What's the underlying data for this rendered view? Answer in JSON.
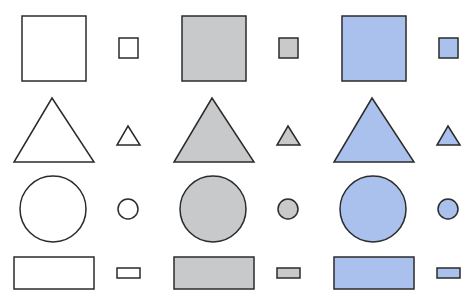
{
  "diagram": {
    "stroke_color": "#2b2b2b",
    "columns": [
      {
        "name": "white",
        "fill": "#ffffff"
      },
      {
        "name": "gray",
        "fill": "#c8c9cb"
      },
      {
        "name": "blue",
        "fill": "#a9c1ec"
      }
    ],
    "rows": [
      "square",
      "triangle",
      "circle",
      "rectangle"
    ],
    "sizes": [
      "large",
      "small"
    ]
  }
}
